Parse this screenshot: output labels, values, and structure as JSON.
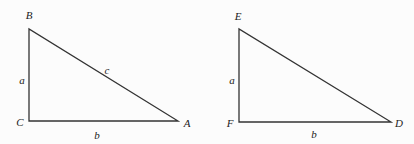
{
  "figure": {
    "triangles": [
      {
        "id": "triangle-abc",
        "vertices": {
          "B": [
            29,
            29
          ],
          "C": [
            29,
            121
          ],
          "A": [
            178,
            121
          ]
        },
        "labels": {
          "B": {
            "text": "B",
            "pos": [
              29,
              15
            ]
          },
          "C": {
            "text": "C",
            "pos": [
              20,
              122
            ]
          },
          "A": {
            "text": "A",
            "pos": [
              187,
              123
            ]
          },
          "a": {
            "text": "a",
            "pos": [
              22,
              80
            ]
          },
          "b": {
            "text": "b",
            "pos": [
              97,
              135
            ]
          },
          "c": {
            "text": "c",
            "pos": [
              107,
              70
            ]
          }
        }
      },
      {
        "id": "triangle-def",
        "vertices": {
          "E": [
            239,
            29
          ],
          "F": [
            239,
            122
          ],
          "D": [
            391,
            122
          ]
        },
        "labels": {
          "E": {
            "text": "E",
            "pos": [
              238,
              16
            ]
          },
          "F": {
            "text": "F",
            "pos": [
              230,
              123
            ]
          },
          "D": {
            "text": "D",
            "pos": [
              399,
              123
            ]
          },
          "a": {
            "text": "a",
            "pos": [
              232,
              80
            ]
          },
          "b": {
            "text": "b",
            "pos": [
              314,
              134
            ]
          }
        }
      }
    ],
    "stroke_color": "#333333"
  }
}
